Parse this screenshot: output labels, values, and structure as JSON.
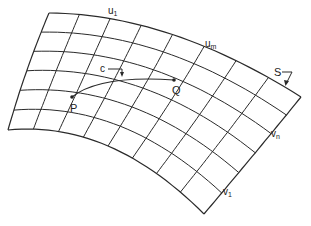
{
  "diagram": {
    "labels": {
      "u_first": "u",
      "u_first_sub": "1",
      "u_last": "u",
      "u_last_sub": "m",
      "v_first": "v",
      "v_first_sub": "1",
      "v_last": "v",
      "v_last_sub": "n",
      "surface": "S",
      "curve": "c",
      "point_p": "P",
      "point_q": "Q"
    },
    "grid": {
      "u_lines": 9,
      "v_lines": 7
    },
    "colors": {
      "stroke": "#2a2a2a",
      "background": "#ffffff"
    }
  }
}
